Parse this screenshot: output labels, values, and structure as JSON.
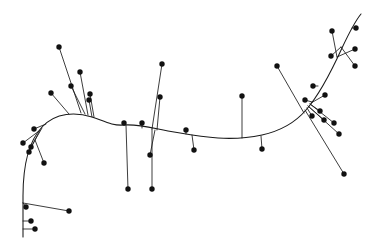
{
  "figure": {
    "title": "",
    "background_color": "#ffffff",
    "width": 380,
    "height": 248
  },
  "chart_data": {
    "type": "scatter",
    "title": "",
    "subtitle": "",
    "xlabel": "",
    "ylabel": "",
    "xlim": [
      0,
      380
    ],
    "ylim": [
      0,
      248
    ],
    "grid": false,
    "legend": null,
    "axes_visible": false,
    "tick_labels_x": [],
    "tick_labels_y": [],
    "annotations": [],
    "style": {
      "curve_color": "#1a1a1a",
      "curve_width": 1.05,
      "residual_color": "#1a1a1a",
      "residual_width": 0.85,
      "point_color": "#111111",
      "point_radius": 2.7
    },
    "curve": {
      "name": "fitted-principal-curve",
      "path": "M 23,237 L 23,196 C 23,168 28,142 42,127 C 56,112 76,112 92,117 C 104,121 112,126 124,125 C 140,124 152,128 168,131 C 186,134 200,137 218,138 C 234,139 248,138 262,135 C 280,131 294,124 306,110 C 320,94 332,70 342,48 C 350,31 356,20 361,14",
      "x_start": 23,
      "y_start": 237,
      "x_end": 361,
      "y_end": 14
    },
    "series": [
      {
        "name": "observations",
        "point_count": 41,
        "points": [
          {
            "id": 1,
            "x": 59,
            "y": 47,
            "proj_x": 81,
            "proj_y": 113
          },
          {
            "id": 2,
            "x": 51,
            "y": 93,
            "proj_x": 69,
            "proj_y": 114
          },
          {
            "id": 3,
            "x": 71,
            "y": 86,
            "proj_x": 85,
            "proj_y": 114
          },
          {
            "id": 4,
            "x": 80,
            "y": 72,
            "proj_x": 88,
            "proj_y": 115
          },
          {
            "id": 5,
            "x": 89,
            "y": 100,
            "proj_x": 92,
            "proj_y": 117
          },
          {
            "id": 6,
            "x": 90,
            "y": 94,
            "proj_x": 94,
            "proj_y": 117
          },
          {
            "id": 7,
            "x": 34,
            "y": 129,
            "proj_x": 46,
            "proj_y": 124
          },
          {
            "id": 8,
            "x": 23,
            "y": 143,
            "proj_x": 39,
            "proj_y": 131
          },
          {
            "id": 9,
            "x": 29,
            "y": 152,
            "proj_x": 40,
            "proj_y": 130
          },
          {
            "id": 10,
            "x": 31,
            "y": 147,
            "proj_x": 42,
            "proj_y": 128
          },
          {
            "id": 11,
            "x": 44,
            "y": 163,
            "proj_x": 35,
            "proj_y": 140
          },
          {
            "id": 12,
            "x": 26,
            "y": 207,
            "proj_x": 23,
            "proj_y": 203
          },
          {
            "id": 13,
            "x": 69,
            "y": 211,
            "proj_x": 23,
            "proj_y": 203
          },
          {
            "id": 14,
            "x": 31,
            "y": 221,
            "proj_x": 23,
            "proj_y": 221
          },
          {
            "id": 15,
            "x": 35,
            "y": 229,
            "proj_x": 23,
            "proj_y": 229
          },
          {
            "id": 16,
            "x": 124,
            "y": 123,
            "proj_x": 124,
            "proj_y": 125
          },
          {
            "id": 17,
            "x": 128,
            "y": 189,
            "proj_x": 126,
            "proj_y": 125
          },
          {
            "id": 18,
            "x": 162,
            "y": 64,
            "proj_x": 152,
            "proj_y": 129
          },
          {
            "id": 19,
            "x": 152,
            "y": 189,
            "proj_x": 152,
            "proj_y": 129
          },
          {
            "id": 20,
            "x": 160,
            "y": 97,
            "proj_x": 157,
            "proj_y": 130
          },
          {
            "id": 21,
            "x": 150,
            "y": 155,
            "proj_x": 155,
            "proj_y": 130
          },
          {
            "id": 22,
            "x": 142,
            "y": 123,
            "proj_x": 142,
            "proj_y": 128
          },
          {
            "id": 23,
            "x": 186,
            "y": 130,
            "proj_x": 186,
            "proj_y": 134
          },
          {
            "id": 24,
            "x": 194,
            "y": 150,
            "proj_x": 192,
            "proj_y": 135
          },
          {
            "id": 25,
            "x": 242,
            "y": 96,
            "proj_x": 242,
            "proj_y": 138
          },
          {
            "id": 26,
            "x": 262,
            "y": 149,
            "proj_x": 261,
            "proj_y": 136
          },
          {
            "id": 27,
            "x": 277,
            "y": 66,
            "proj_x": 304,
            "proj_y": 113
          },
          {
            "id": 28,
            "x": 305,
            "y": 100,
            "proj_x": 312,
            "proj_y": 102
          },
          {
            "id": 29,
            "x": 332,
            "y": 31,
            "proj_x": 337,
            "proj_y": 57
          },
          {
            "id": 30,
            "x": 355,
            "y": 49,
            "proj_x": 337,
            "proj_y": 57
          },
          {
            "id": 31,
            "x": 356,
            "y": 28,
            "proj_x": 352,
            "proj_y": 28
          },
          {
            "id": 32,
            "x": 331,
            "y": 56,
            "proj_x": 341,
            "proj_y": 47
          },
          {
            "id": 33,
            "x": 355,
            "y": 66,
            "proj_x": 341,
            "proj_y": 47
          },
          {
            "id": 34,
            "x": 313,
            "y": 86,
            "proj_x": 318,
            "proj_y": 86
          },
          {
            "id": 35,
            "x": 320,
            "y": 111,
            "proj_x": 310,
            "proj_y": 104
          },
          {
            "id": 36,
            "x": 334,
            "y": 123,
            "proj_x": 310,
            "proj_y": 104
          },
          {
            "id": 37,
            "x": 324,
            "y": 120,
            "proj_x": 308,
            "proj_y": 106
          },
          {
            "id": 38,
            "x": 339,
            "y": 134,
            "proj_x": 308,
            "proj_y": 106
          },
          {
            "id": 39,
            "x": 312,
            "y": 116,
            "proj_x": 307,
            "proj_y": 108
          },
          {
            "id": 40,
            "x": 344,
            "y": 174,
            "proj_x": 305,
            "proj_y": 110
          },
          {
            "id": 41,
            "x": 325,
            "y": 95,
            "proj_x": 311,
            "proj_y": 103
          }
        ]
      }
    ]
  }
}
